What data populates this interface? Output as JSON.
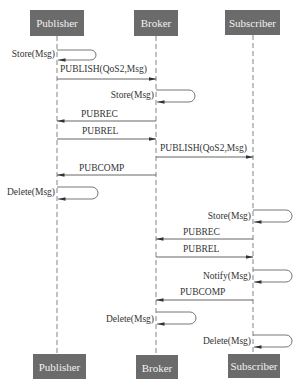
{
  "diagram": {
    "type": "sequence",
    "colors": {
      "actor_box": "#6b6b6b",
      "actor_text": "#f2f2f2",
      "lines": "#555555",
      "background": "#ffffff"
    },
    "actors": [
      {
        "id": "publisher",
        "label": "Publisher",
        "x": 57
      },
      {
        "id": "broker",
        "label": "Broker",
        "x": 156
      },
      {
        "id": "subscriber",
        "label": "Subscriber",
        "x": 253
      }
    ],
    "messages": [
      {
        "from": "publisher",
        "to": "publisher",
        "label": "Store(Msg)",
        "y": 52
      },
      {
        "from": "publisher",
        "to": "broker",
        "label": "PUBLISH(QoS2,Msg)",
        "y": 79
      },
      {
        "from": "broker",
        "to": "broker",
        "label": "Store(Msg)",
        "y": 90
      },
      {
        "from": "broker",
        "to": "publisher",
        "label": "PUBREC",
        "y": 121
      },
      {
        "from": "publisher",
        "to": "broker",
        "label": "PUBREL",
        "y": 139
      },
      {
        "from": "broker",
        "to": "subscriber",
        "label": "PUBLISH(QoS2,Msg)",
        "y": 157
      },
      {
        "from": "broker",
        "to": "publisher",
        "label": "PUBCOMP",
        "y": 175
      },
      {
        "from": "publisher",
        "to": "publisher",
        "label": "Delete(Msg)",
        "y": 188
      },
      {
        "from": "subscriber",
        "to": "subscriber",
        "label": "Store(Msg)",
        "y": 210
      },
      {
        "from": "subscriber",
        "to": "broker",
        "label": "PUBREC",
        "y": 239
      },
      {
        "from": "broker",
        "to": "subscriber",
        "label": "PUBREL",
        "y": 257
      },
      {
        "from": "subscriber",
        "to": "subscriber",
        "label": "Notify(Msg)",
        "y": 270
      },
      {
        "from": "subscriber",
        "to": "broker",
        "label": "PUBCOMP",
        "y": 300
      },
      {
        "from": "broker",
        "to": "broker",
        "label": "Delete(Msg)",
        "y": 312
      },
      {
        "from": "subscriber",
        "to": "subscriber",
        "label": "Delete(Msg)",
        "y": 335
      }
    ]
  }
}
